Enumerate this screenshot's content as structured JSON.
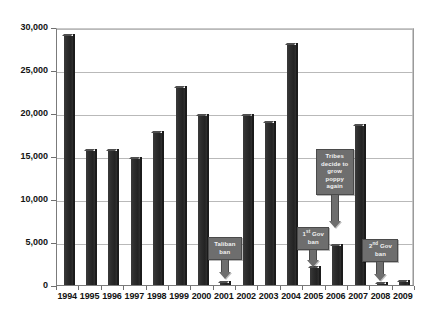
{
  "chart_data": {
    "type": "bar",
    "title": "",
    "subtitle": "",
    "xlabel": "",
    "ylabel": "",
    "grid": true,
    "legend": "none",
    "ylim": [
      0,
      30000
    ],
    "ytick_step": 5000,
    "ytick_labels": [
      "30,000",
      "25,000",
      "20,000",
      "15,000",
      "10,000",
      "5,000",
      "0"
    ],
    "ytick_values": [
      30000,
      25000,
      20000,
      15000,
      10000,
      5000,
      0
    ],
    "categories": [
      "1994",
      "1995",
      "1996",
      "1997",
      "1998",
      "1999",
      "2000",
      "2001",
      "2002",
      "2003",
      "2004",
      "2005",
      "2006",
      "2007",
      "2008",
      "2009"
    ],
    "values": [
      28900,
      15600,
      15600,
      14600,
      17700,
      22900,
      19700,
      185,
      19600,
      18800,
      27900,
      2000,
      4500,
      18500,
      120,
      310
    ],
    "annotations": [
      {
        "id": "taliban-ban",
        "label": "Taliban ban",
        "lines": [
          "Taliban",
          "ban"
        ],
        "target_category": "2001"
      },
      {
        "id": "tribes-regrow",
        "label": "Tribes decide to grow poppy again",
        "lines": [
          "Tribes",
          "decide to",
          "grow",
          "poppy",
          "again"
        ],
        "target_category": "2006"
      },
      {
        "id": "first-gov-ban",
        "label": "1st Gov ban",
        "lines": [
          "1st Gov",
          "ban"
        ],
        "ordinal": "1",
        "ordinal_suffix": "st",
        "target_category": "2005"
      },
      {
        "id": "second-gov-ban",
        "label": "2nd Gov ban",
        "lines": [
          "2nd Gov",
          "ban"
        ],
        "ordinal": "2",
        "ordinal_suffix": "nd",
        "target_category": "2008"
      }
    ],
    "colors": {
      "bar": "#2b2b2b",
      "gridline": "#b9b9b9",
      "axis": "#7b7b7b",
      "callout_fill": "#6e6e6e",
      "callout_text": "#f2f2f2",
      "background": "#ffffff"
    }
  }
}
